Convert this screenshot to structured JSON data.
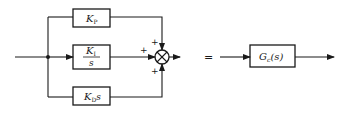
{
  "diagram": {
    "title": "",
    "blocks": {
      "kp": {
        "main": "K",
        "sub": "P"
      },
      "ki": {
        "numerator_main": "K",
        "numerator_sub": "I",
        "denominator": "s"
      },
      "kd": {
        "main": "K",
        "sub": "D",
        "suffix": "s"
      },
      "gc": {
        "main": "G",
        "sub": "c",
        "arg": "(s)"
      }
    },
    "summing_junction": {
      "signs": {
        "top": "+",
        "left": "+",
        "bottom": "+"
      }
    },
    "equals_sign": "=",
    "colors": {
      "line": "#1a1a1a",
      "background": "#ffffff"
    }
  }
}
